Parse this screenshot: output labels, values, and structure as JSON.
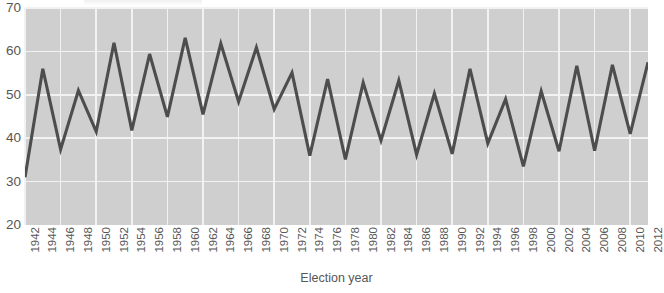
{
  "chart_data": {
    "type": "line",
    "title": "",
    "xlabel": "Election year",
    "ylabel": "",
    "xlim": [
      1942,
      2012
    ],
    "ylim": [
      20,
      70
    ],
    "yticks": [
      20,
      30,
      40,
      50,
      60,
      70
    ],
    "grid": true,
    "legend": false,
    "plot_background": "#cfcfcf",
    "grid_color": "#f2f2f2",
    "line_color": "#4d4d4d",
    "categories": [
      1942,
      1944,
      1946,
      1948,
      1950,
      1952,
      1954,
      1956,
      1958,
      1960,
      1962,
      1964,
      1966,
      1968,
      1970,
      1972,
      1974,
      1976,
      1978,
      1980,
      1982,
      1984,
      1986,
      1988,
      1990,
      1992,
      1994,
      1996,
      1998,
      2000,
      2002,
      2004,
      2006,
      2008,
      2010,
      2012
    ],
    "values": [
      31.0,
      56.0,
      37.4,
      51.0,
      41.5,
      62.0,
      41.8,
      59.4,
      44.9,
      63.1,
      45.5,
      61.8,
      48.4,
      60.9,
      46.7,
      55.1,
      36.0,
      53.6,
      35.1,
      52.8,
      39.5,
      53.3,
      36.2,
      50.3,
      36.4,
      56.0,
      38.8,
      49.0,
      33.5,
      50.8,
      37.0,
      56.7,
      37.1,
      56.9,
      41.0,
      57.5
    ]
  },
  "axis": {
    "y_tick_labels": [
      "20",
      "30",
      "40",
      "50",
      "60",
      "70"
    ],
    "x_tick_labels": [
      "1942",
      "1944",
      "1946",
      "1948",
      "1950",
      "1952",
      "1954",
      "1956",
      "1958",
      "1960",
      "1962",
      "1964",
      "1966",
      "1968",
      "1970",
      "1972",
      "1974",
      "1976",
      "1978",
      "1980",
      "1982",
      "1984",
      "1986",
      "1988",
      "1990",
      "1992",
      "1994",
      "1996",
      "1998",
      "2000",
      "2002",
      "2004",
      "2006",
      "2008",
      "2010",
      "2012"
    ],
    "x_title": "Election year"
  }
}
